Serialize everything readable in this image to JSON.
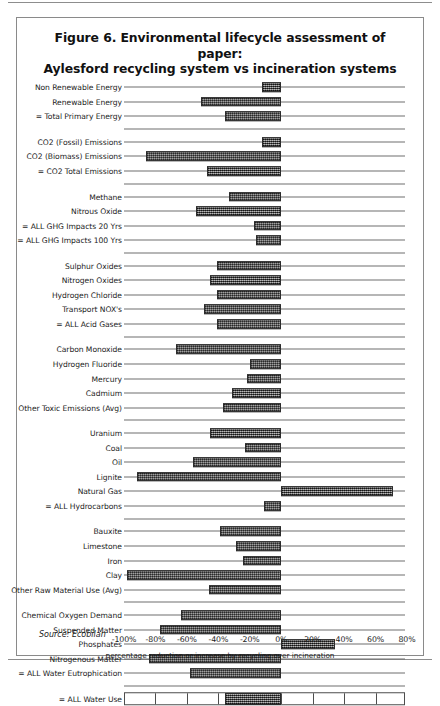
{
  "figure": {
    "title_line1": "Figure 6. Environmental lifecycle assessment of paper:",
    "title_line2": "Aylesford recycling system vs incineration systems",
    "source": "Source: Ecobilan"
  },
  "chart_data": {
    "type": "bar",
    "orientation": "horizontal",
    "title": "Figure 6. Environmental lifecycle assessment of paper: Aylesford recycling system vs incineration systems",
    "xlabel": "percentage reduction or increase by recycling over incineration",
    "ylabel": "",
    "xlim": [
      -100,
      80
    ],
    "xticks": [
      -100,
      -80,
      -60,
      -40,
      -20,
      0,
      20,
      40,
      60,
      80
    ],
    "xtick_labels": [
      "-100%",
      "-80%",
      "-60%",
      "-40%",
      "-20%",
      "0%",
      "20%",
      "40%",
      "60%",
      "80%"
    ],
    "grid": false,
    "legend": "none",
    "units": "percent",
    "bar_color": "#5c5c5c",
    "zero_line_color": "#4a4a4a",
    "categories": [
      "Non Renewable Energy",
      "Renewable Energy",
      "= Total Primary Energy",
      "CO2 (Fossil) Emissions",
      "CO2 (Biomass) Emissions",
      "= CO2 Total Emissions",
      "Methane",
      "Nitrous Oxide",
      "= ALL GHG Impacts 20 Yrs",
      "= ALL GHG Impacts 100 Yrs",
      "Sulphur Oxides",
      "Nitrogen Oxides",
      "Hydrogen Chloride",
      "Transport NOX's",
      "= ALL Acid Gases",
      "Carbon Monoxide",
      "Hydrogen Fluoride",
      "Mercury",
      "Cadmium",
      "Other Toxic Emissions (Avg)",
      "Uranium",
      "Coal",
      "Oil",
      "Lignite",
      "Natural Gas",
      "= ALL Hydrocarbons",
      "Bauxite",
      "Limestone",
      "Iron",
      "Clay",
      "Other Raw Material Use (Avg)",
      "Chemical Oxygen Demand",
      "Suspended Matter",
      "Phosphates",
      "Nitrogenous Matter",
      "= ALL Water Eutrophication",
      "= ALL Water Use"
    ],
    "values": [
      -12,
      -51,
      -36,
      -12,
      -86,
      -47,
      -33,
      -54,
      -17,
      -16,
      -41,
      -45,
      -41,
      -49,
      -41,
      -67,
      -20,
      -22,
      -31,
      -37,
      -45,
      -23,
      -56,
      -92,
      71,
      -11,
      -39,
      -29,
      -24,
      -98,
      -46,
      -64,
      -77,
      34,
      -84,
      -58,
      -36
    ],
    "groups": [
      {
        "name": "energy",
        "categories": [
          "Non Renewable Energy",
          "Renewable Energy",
          "= Total Primary Energy"
        ]
      },
      {
        "name": "co2",
        "categories": [
          "CO2 (Fossil) Emissions",
          "CO2 (Biomass) Emissions",
          "= CO2 Total Emissions"
        ]
      },
      {
        "name": "greenhouse-gases",
        "categories": [
          "Methane",
          "Nitrous Oxide",
          "= ALL GHG Impacts 20 Yrs",
          "= ALL GHG Impacts 100 Yrs"
        ]
      },
      {
        "name": "acid-gases",
        "categories": [
          "Sulphur Oxides",
          "Nitrogen Oxides",
          "Hydrogen Chloride",
          "Transport NOX's",
          "= ALL Acid Gases"
        ]
      },
      {
        "name": "toxic-emissions",
        "categories": [
          "Carbon Monoxide",
          "Hydrogen Fluoride",
          "Mercury",
          "Cadmium",
          "Other Toxic Emissions (Avg)"
        ]
      },
      {
        "name": "hydrocarbons",
        "categories": [
          "Uranium",
          "Coal",
          "Oil",
          "Lignite",
          "Natural Gas",
          "= ALL Hydrocarbons"
        ]
      },
      {
        "name": "raw-materials",
        "categories": [
          "Bauxite",
          "Limestone",
          "Iron",
          "Clay",
          "Other Raw Material Use (Avg)"
        ]
      },
      {
        "name": "water-eutrophication",
        "categories": [
          "Chemical Oxygen Demand",
          "Suspended Matter",
          "Phosphates",
          "Nitrogenous Matter",
          "= ALL Water Eutrophication"
        ]
      },
      {
        "name": "water-use",
        "categories": [
          "= ALL Water Use"
        ]
      }
    ]
  }
}
